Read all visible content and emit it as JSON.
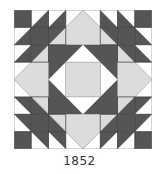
{
  "caption": "1852",
  "quilt_block": {
    "grid": 8,
    "colors": {
      "dark": "#555555",
      "light": "#dcdcdc",
      "white": "#ffffff",
      "line": "#777777"
    }
  }
}
